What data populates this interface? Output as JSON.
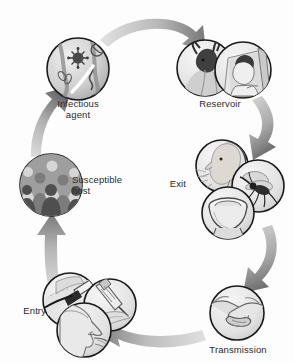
{
  "diagram": {
    "type": "cycle",
    "orientation": "clockwise",
    "palette": {
      "arrow_light": "#cfcfcf",
      "arrow_mid": "#9a9a9a",
      "arrow_dark": "#6f6f6f",
      "circle_stroke": "#1a1a1a",
      "circle_fill_light": "#e8e8e8",
      "circle_fill_mid": "#bdbdbd",
      "circle_fill_dark": "#8a8a8a",
      "text": "#2b2b2b",
      "background": "#ffffff"
    },
    "nodes": [
      {
        "id": "infectious-agent",
        "label": "Infectious\nagent",
        "label_align": "center",
        "order": 1,
        "icons": [
          "microbe-icon",
          "virus-icon",
          "bacteria-icon"
        ],
        "illustration": "micrograph of microorganisms: virus particle, bacilli and spirochete"
      },
      {
        "id": "reservoir",
        "label": "Reservoir",
        "label_align": "center",
        "order": 2,
        "icons": [
          "deer-icon",
          "patient-in-bed-icon"
        ],
        "illustration": "animal reservoir (deer) and human reservoir (person lying in bed)"
      },
      {
        "id": "exit",
        "label": "Exit",
        "label_align": "right",
        "order": 3,
        "icons": [
          "sneezing-person-icon",
          "mosquito-icon",
          "toilet-icon"
        ],
        "illustration": "portal of exit: respiratory sneeze, vector mosquito, fecal toilet"
      },
      {
        "id": "transmission",
        "label": "Transmission",
        "label_align": "center",
        "order": 4,
        "icons": [
          "handshake-icon"
        ],
        "illustration": "two hands shaking indicating contact transmission"
      },
      {
        "id": "entry",
        "label": "Entry",
        "label_align": "right",
        "order": 5,
        "icons": [
          "scalpel-skin-icon",
          "syringe-icon",
          "face-profile-icon"
        ],
        "illustration": "portal of entry: break in skin, injection, mouth and nose of a face"
      },
      {
        "id": "susceptible-host",
        "label": "Susceptible\nhost",
        "label_align": "left",
        "order": 6,
        "icons": [
          "crowd-icon"
        ],
        "illustration": "crowd of human silhouettes representing a susceptible population"
      }
    ],
    "edges": [
      {
        "id": "edge-agent-to-reservoir",
        "from": "infectious-agent",
        "to": "reservoir",
        "direction": "clockwise"
      },
      {
        "id": "edge-reservoir-to-exit",
        "from": "reservoir",
        "to": "exit",
        "direction": "clockwise"
      },
      {
        "id": "edge-exit-to-transmission",
        "from": "exit",
        "to": "transmission",
        "direction": "clockwise"
      },
      {
        "id": "edge-transmission-to-entry",
        "from": "transmission",
        "to": "entry",
        "direction": "clockwise"
      },
      {
        "id": "edge-entry-to-host",
        "from": "entry",
        "to": "susceptible-host",
        "direction": "clockwise"
      },
      {
        "id": "edge-host-to-agent",
        "from": "susceptible-host",
        "to": "infectious-agent",
        "direction": "clockwise"
      }
    ]
  }
}
